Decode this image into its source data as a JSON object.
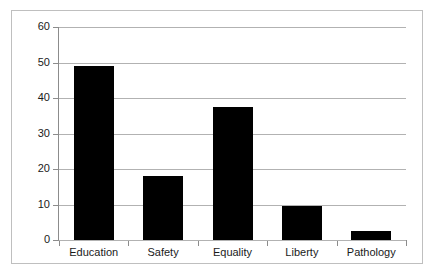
{
  "chart_data": {
    "type": "bar",
    "title": "",
    "subtitle": "",
    "xlabel": "",
    "ylabel": "",
    "categories": [
      "Education",
      "Safety",
      "Equality",
      "Liberty",
      "Pathology"
    ],
    "values": [
      49,
      18,
      37.5,
      9.5,
      2.5
    ],
    "ylim": [
      0,
      60
    ],
    "yticks": [
      0,
      10,
      20,
      30,
      40,
      50,
      60
    ],
    "ytick_labels": [
      "0",
      "10",
      "20",
      "30",
      "40",
      "50",
      "60"
    ],
    "grid": "horizontal",
    "legend": "none",
    "bar_color": "#000000",
    "gridline_color": "#b2b2b2",
    "axis_color": "#8c8c8c",
    "frame_color": "#bfbfbf",
    "background": "#ffffff"
  }
}
